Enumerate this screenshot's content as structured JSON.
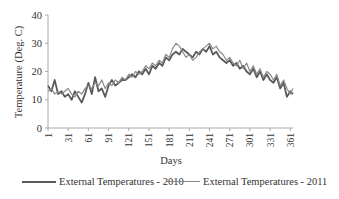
{
  "chart_data": {
    "type": "line",
    "title": "",
    "xlabel": "Days",
    "ylabel": "Temperature (Deg. C)",
    "ylim": [
      0,
      40
    ],
    "xlim": [
      1,
      365
    ],
    "yticks": [
      0,
      10,
      20,
      30,
      40
    ],
    "xticks": [
      1,
      31,
      61,
      91,
      121,
      151,
      181,
      211,
      241,
      271,
      301,
      331,
      361
    ],
    "grid": false,
    "legend_position": "bottom",
    "x": [
      1,
      6,
      11,
      16,
      21,
      26,
      31,
      36,
      41,
      46,
      51,
      56,
      61,
      66,
      71,
      76,
      81,
      86,
      91,
      96,
      101,
      106,
      111,
      116,
      121,
      126,
      131,
      136,
      141,
      146,
      151,
      156,
      161,
      166,
      171,
      176,
      181,
      186,
      191,
      196,
      201,
      206,
      211,
      216,
      221,
      226,
      231,
      236,
      241,
      246,
      251,
      256,
      261,
      266,
      271,
      276,
      281,
      286,
      291,
      296,
      301,
      306,
      311,
      316,
      321,
      326,
      331,
      336,
      341,
      346,
      351,
      356,
      361,
      365
    ],
    "series": [
      {
        "name": "External Temperatures - 2010",
        "color": "#5a5a5a",
        "values": [
          15,
          13,
          17,
          12,
          13,
          11,
          12,
          10,
          13,
          11,
          9,
          12,
          16,
          12,
          18,
          13,
          14,
          11,
          15,
          17,
          15,
          16,
          17,
          17,
          18,
          19,
          18,
          20,
          19,
          21,
          19,
          22,
          21,
          23,
          22,
          25,
          24,
          26,
          27,
          26,
          28,
          27,
          26,
          25,
          27,
          26,
          28,
          27,
          29,
          26,
          27,
          25,
          24,
          23,
          24,
          22,
          23,
          21,
          22,
          20,
          19,
          21,
          18,
          20,
          17,
          19,
          17,
          16,
          18,
          14,
          16,
          11,
          13,
          12
        ]
      },
      {
        "name": "External Temperatures - 2011",
        "color": "#8a8a8a",
        "values": [
          13,
          14,
          12,
          13,
          12,
          13,
          14,
          12,
          11,
          13,
          12,
          14,
          15,
          14,
          16,
          15,
          17,
          14,
          16,
          15,
          17,
          16,
          18,
          17,
          19,
          18,
          20,
          19,
          20,
          22,
          21,
          23,
          22,
          24,
          23,
          26,
          25,
          28,
          30,
          29,
          27,
          25,
          26,
          24,
          25,
          27,
          28,
          29,
          30,
          28,
          29,
          27,
          26,
          24,
          25,
          23,
          22,
          24,
          21,
          23,
          20,
          22,
          19,
          21,
          18,
          20,
          19,
          17,
          19,
          15,
          17,
          14,
          12,
          14
        ]
      }
    ]
  },
  "axes": {
    "ylabel": "Temperature (Deg. C)",
    "xlabel": "Days"
  },
  "legend": {
    "items": [
      {
        "label": "External Temperatures - 2010"
      },
      {
        "label": "External Temperatures - 2011"
      }
    ]
  }
}
